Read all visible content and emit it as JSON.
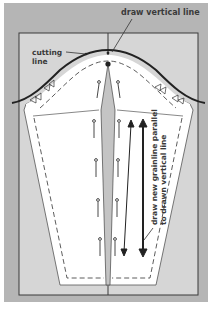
{
  "figure": {
    "type": "sewing-pattern-sleeve-alteration",
    "colors": {
      "frame": "#b5b5b5",
      "panel": "#d6d6d6",
      "pattern_piece": "#ffffff",
      "dart": "#c4c4c4",
      "ink": "#2a2a2a",
      "label": "#3a3a3a"
    },
    "labels": {
      "draw_vertical_line": "draw vertical line",
      "cutting_line_1": "cutting",
      "cutting_line_2": "line",
      "grainline_1": "draw new grainline parallel",
      "grainline_2": "to drawn vertical line"
    },
    "elements": {
      "pins_count": 8,
      "arrows_count": 2
    }
  }
}
